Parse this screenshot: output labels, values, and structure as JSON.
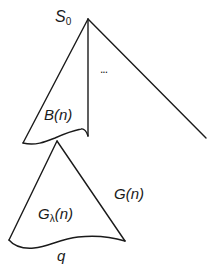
{
  "diagram": {
    "colors": {
      "stroke": "#1a1a1a",
      "background": "#ffffff"
    },
    "labels": {
      "root": {
        "main": "S",
        "sub": "0"
      },
      "ellipsis": "...",
      "b_subtree": "B(n)",
      "g_subtree": "G(n)",
      "g_lambda": {
        "main": "G",
        "sub": "λ",
        "rest": "(n)"
      },
      "q": "q"
    }
  }
}
